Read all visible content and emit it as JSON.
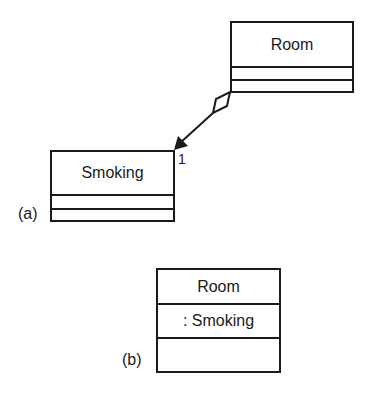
{
  "diagram": {
    "part_a": {
      "label": "(a)",
      "room_class": {
        "name": "Room",
        "attributes": "",
        "operations": ""
      },
      "smoking_class": {
        "name": "Smoking",
        "attributes": "",
        "operations": ""
      },
      "association": {
        "type": "aggregation",
        "from": "Room",
        "to": "Smoking",
        "navigable_to": "Smoking",
        "multiplicity_at_target": "1"
      }
    },
    "part_b": {
      "label": "(b)",
      "room_class": {
        "name": "Room",
        "attributes": ": Smoking",
        "operations": ""
      }
    },
    "colors": {
      "stroke": "#1a1a1a",
      "background": "#ffffff"
    }
  }
}
